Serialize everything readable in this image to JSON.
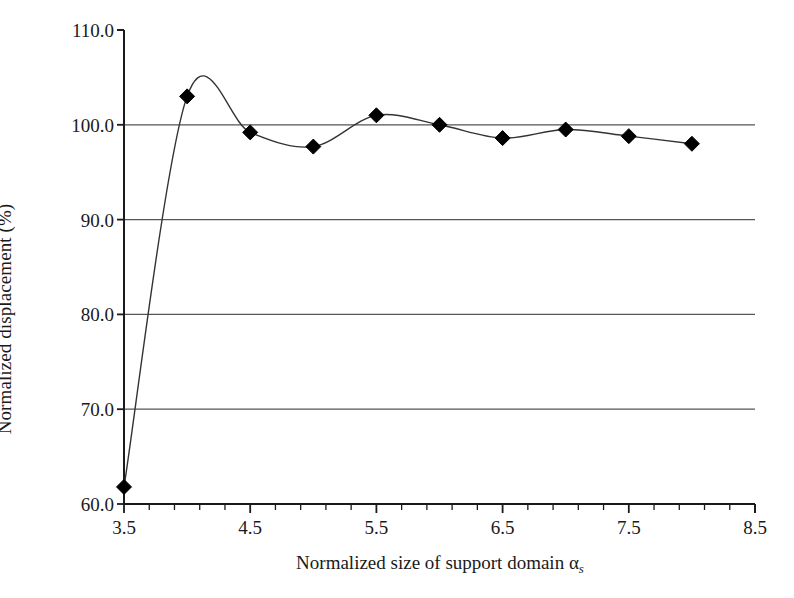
{
  "chart_data": {
    "type": "line",
    "title": "",
    "xlabel": "Normalized size of support domain αs",
    "xlabel_main": "Normalized size of support domain α",
    "xlabel_sub": "s",
    "ylabel": "Normalized displacement (%)",
    "xlim": [
      3.5,
      8.5
    ],
    "ylim": [
      60.0,
      110.0
    ],
    "x_major_step": 1.0,
    "x_minor_step": 0.2,
    "y_major_step": 10.0,
    "grid": "horizontal",
    "legend": "none",
    "marker": "diamond",
    "marker_color": "#000000",
    "line_color": "#333333",
    "x_tick_labels": [
      "3.5",
      "4.5",
      "5.5",
      "6.5",
      "7.5",
      "8.5"
    ],
    "x_tick_values": [
      3.5,
      4.5,
      5.5,
      6.5,
      7.5,
      8.5
    ],
    "y_tick_labels": [
      "110.0",
      "100.0",
      "90.0",
      "80.0",
      "70.0",
      "60.0"
    ],
    "y_tick_values": [
      110.0,
      100.0,
      90.0,
      80.0,
      70.0,
      60.0
    ],
    "series": [
      {
        "name": "Normalized displacement",
        "x": [
          3.5,
          4.0,
          4.5,
          5.0,
          5.5,
          6.0,
          6.5,
          7.0,
          7.5,
          8.0
        ],
        "values": [
          61.8,
          103.0,
          99.2,
          97.7,
          101.0,
          100.0,
          98.6,
          99.5,
          98.8,
          98.0
        ]
      }
    ]
  }
}
